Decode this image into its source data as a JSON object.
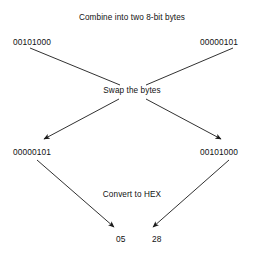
{
  "diagram": {
    "type": "flow-diagram",
    "title": "Combine into two 8-bit bytes",
    "background_color": "#ffffff",
    "line_color": "#1a1a1a",
    "text_color": "#111111",
    "steps": [
      {
        "id": "combine",
        "label": "Combine into two 8-bit bytes"
      },
      {
        "id": "swap",
        "label": "Swap the bytes"
      },
      {
        "id": "convert",
        "label": "Convert to HEX"
      }
    ],
    "inputs": [
      {
        "id": "byte-in-1",
        "value": "00101000",
        "side": "left"
      },
      {
        "id": "byte-in-2",
        "value": "00000101",
        "side": "right"
      }
    ],
    "swapped": [
      {
        "id": "byte-out-1",
        "value": "00000101",
        "side": "left"
      },
      {
        "id": "byte-out-2",
        "value": "00101000",
        "side": "right"
      }
    ],
    "hex_results": [
      {
        "id": "hex-out-1",
        "value": "05",
        "side": "left"
      },
      {
        "id": "hex-out-2",
        "value": "28",
        "side": "right"
      }
    ],
    "connectors": [
      {
        "id": "cross-left-to-right",
        "from": "byte-in-1",
        "to": "swap",
        "arrowhead": false
      },
      {
        "id": "cross-right-to-left",
        "from": "byte-in-2",
        "to": "swap",
        "arrowhead": false
      },
      {
        "id": "swap-to-left",
        "from": "swap",
        "to": "byte-out-1",
        "arrowhead": true
      },
      {
        "id": "swap-to-right",
        "from": "swap",
        "to": "byte-out-2",
        "arrowhead": true
      },
      {
        "id": "left-to-hex-1",
        "from": "byte-out-1",
        "to": "hex-out-1",
        "arrowhead": true
      },
      {
        "id": "right-to-hex-2",
        "from": "byte-out-2",
        "to": "hex-out-2",
        "arrowhead": true
      }
    ]
  }
}
